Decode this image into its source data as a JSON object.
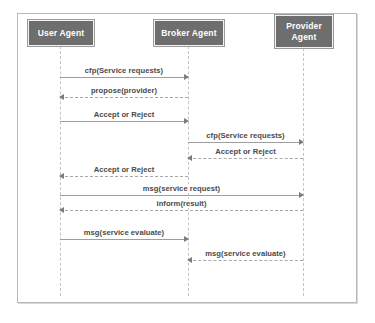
{
  "diagram": {
    "type": "uml-sequence-diagram",
    "colors": {
      "actor_fill": "#6e6e6e",
      "actor_text": "#ffffff",
      "lifeline": "#c4c4c4",
      "message_line": "#9e9e9e",
      "message_text": "#4a4a4a",
      "frame_border": "#b9b9b9",
      "background": "#ffffff"
    },
    "participants": [
      {
        "id": "user",
        "label": "User Agent",
        "x": 60,
        "box_left": 28,
        "box_top": 20,
        "box_width": 66,
        "box_height": 26
      },
      {
        "id": "broker",
        "label": "Broker Agent",
        "x": 188,
        "box_left": 154,
        "box_top": 20,
        "box_width": 70,
        "box_height": 26
      },
      {
        "id": "provider",
        "label": "Provider\nAgent",
        "x": 303,
        "box_left": 275,
        "box_top": 15,
        "box_width": 58,
        "box_height": 33
      }
    ],
    "lifeline_top": 46,
    "lifeline_bottom": 296,
    "messages": [
      {
        "index": 1,
        "label": "cfp(Service requests)",
        "from": "user",
        "to": "broker",
        "direction": "right",
        "style": "solid",
        "y": 66
      },
      {
        "index": 2,
        "label": "propose(provider)",
        "from": "broker",
        "to": "user",
        "direction": "left",
        "style": "dashed",
        "y": 86
      },
      {
        "index": 3,
        "label": "Accept or Reject",
        "from": "user",
        "to": "broker",
        "direction": "right",
        "style": "solid",
        "y": 110
      },
      {
        "index": 4,
        "label": "cfp(Service requests)",
        "from": "broker",
        "to": "provider",
        "direction": "right",
        "style": "solid",
        "y": 131
      },
      {
        "index": 5,
        "label": "Accept or Reject",
        "from": "provider",
        "to": "broker",
        "direction": "left",
        "style": "dashed",
        "y": 147
      },
      {
        "index": 6,
        "label": "Accept or Reject",
        "from": "broker",
        "to": "user",
        "direction": "left",
        "style": "dashed",
        "y": 165
      },
      {
        "index": 7,
        "label": "msg(service request)",
        "from": "user",
        "to": "provider",
        "direction": "right",
        "style": "solid",
        "y": 184
      },
      {
        "index": 8,
        "label": "inform(result)",
        "from": "provider",
        "to": "user",
        "direction": "left",
        "style": "dashed",
        "y": 199
      },
      {
        "index": 9,
        "label": "msg(service evaluate)",
        "from": "user",
        "to": "broker",
        "direction": "right",
        "style": "solid",
        "y": 228
      },
      {
        "index": 10,
        "label": "msg(service evaluate)",
        "from": "provider",
        "to": "broker",
        "direction": "left",
        "style": "dashed",
        "y": 249
      }
    ]
  }
}
